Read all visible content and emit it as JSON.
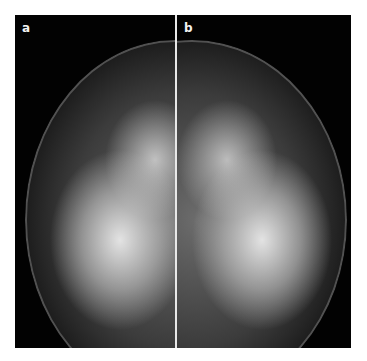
{
  "figure": {
    "panels": [
      {
        "label": "a",
        "description": "mammogram left panel"
      },
      {
        "label": "b",
        "description": "mammogram right panel"
      }
    ],
    "colors": {
      "background": "#000000",
      "divider": "#e8e8e8",
      "label": "#f2f2f2"
    }
  }
}
